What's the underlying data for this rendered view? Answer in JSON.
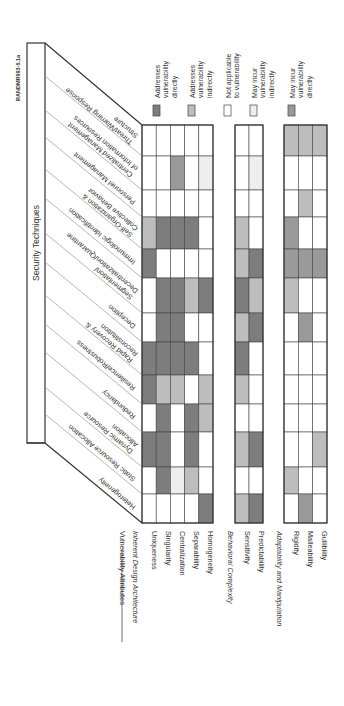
{
  "figure_id": "RANDMR993-5.1a",
  "header": {
    "title": "Security Techniques"
  },
  "attributes_header": "Vulnerability Attributes",
  "legend": [
    {
      "key": "D",
      "label_lines": [
        "Addresses",
        "vulnerability",
        "directly"
      ],
      "color": "#7d7d7d"
    },
    {
      "key": "I",
      "label_lines": [
        "Addresses",
        "vulnerability",
        "indirectly"
      ],
      "color": "#bdbdbd"
    },
    {
      "key": "N",
      "label_lines": [
        "Not applicable",
        "to vulnerability"
      ],
      "color": "#ffffff"
    },
    {
      "key": "m",
      "label_lines": [
        "May incur",
        "vulnerability",
        "indirectly"
      ],
      "color": "#eeeeee"
    },
    {
      "key": "M",
      "label_lines": [
        "May incur",
        "vulnerability",
        "directly"
      ],
      "color": "#9a9a9a"
    }
  ],
  "groups": [
    {
      "name": "Inherent Design Architecture",
      "attributes": [
        "Uniqueness",
        "Singularity",
        "Centralization",
        "Separability",
        "Homogeneity"
      ]
    },
    {
      "name": "Behavioral Complexity",
      "attributes": [
        "Sensitivity",
        "Predictability"
      ]
    },
    {
      "name": "Adaptability and Manipulation",
      "attributes": [
        "Rigidity",
        "Malleability",
        "Gullibility"
      ]
    }
  ],
  "techniques": [
    {
      "lines": [
        "Threat/Warning Response",
        "Structure"
      ]
    },
    {
      "lines": [
        "Centralized Management",
        "of Information Resources"
      ]
    },
    {
      "lines": [
        "Personnel Management"
      ]
    },
    {
      "lines": [
        "Self-Organization &",
        "Collective Behavior"
      ]
    },
    {
      "lines": [
        "Immunologic Identification"
      ]
    },
    {
      "lines": [
        "Segmentation/",
        "Decentralization/Quarantine"
      ]
    },
    {
      "lines": [
        "Deception"
      ]
    },
    {
      "lines": [
        "Rapid Recovery &",
        "Reconstitution"
      ]
    },
    {
      "lines": [
        "Resilience/Robustness"
      ]
    },
    {
      "lines": [
        "Redundancy"
      ]
    },
    {
      "lines": [
        "Dynamic Resource",
        "Allocation"
      ]
    },
    {
      "lines": [
        "Static Resource Allocation"
      ]
    },
    {
      "lines": [
        "Heterogeneity"
      ]
    }
  ],
  "chart_data": {
    "type": "table",
    "columns": [
      "Uniqueness",
      "Singularity",
      "Centralization",
      "Separability",
      "Homogeneity",
      "Sensitivity",
      "Predictability",
      "Rigidity",
      "Malleability",
      "Gullibility"
    ],
    "legend_codes": {
      "D": "Addresses vulnerability directly",
      "I": "Addresses vulnerability indirectly",
      "N": "Not applicable to vulnerability",
      "m": "May incur vulnerability indirectly",
      "M": "May incur vulnerability directly"
    },
    "rows": [
      {
        "technique": "Threat/Warning Response Structure",
        "values": [
          "N",
          "N",
          "N",
          "N",
          "N",
          "N",
          "N",
          "I",
          "I",
          "I"
        ]
      },
      {
        "technique": "Centralized Management of Information Resources",
        "values": [
          "N",
          "N",
          "M",
          "N",
          "m",
          "N",
          "m",
          "N",
          "N",
          "N"
        ]
      },
      {
        "technique": "Personnel Management",
        "values": [
          "N",
          "N",
          "N",
          "N",
          "N",
          "N",
          "N",
          "N",
          "I",
          "N"
        ]
      },
      {
        "technique": "Self-Organization & Collective Behavior",
        "values": [
          "I",
          "D",
          "D",
          "D",
          "N",
          "I",
          "N",
          "M",
          "N",
          "N"
        ]
      },
      {
        "technique": "Immunologic Identification",
        "values": [
          "D",
          "N",
          "N",
          "N",
          "N",
          "I",
          "D",
          "M",
          "M",
          "M"
        ]
      },
      {
        "technique": "Segmentation/Decentralization/Quarantine",
        "values": [
          "N",
          "D",
          "D",
          "I",
          "D",
          "D",
          "I",
          "I",
          "N",
          "N"
        ]
      },
      {
        "technique": "Deception",
        "values": [
          "N",
          "D",
          "D",
          "N",
          "N",
          "I",
          "D",
          "N",
          "M",
          "N"
        ]
      },
      {
        "technique": "Rapid Recovery & Reconstitution",
        "values": [
          "D",
          "D",
          "D",
          "D",
          "N",
          "D",
          "N",
          "N",
          "N",
          "N"
        ]
      },
      {
        "technique": "Resilience/Robustness",
        "values": [
          "D",
          "I",
          "I",
          "N",
          "I",
          "I",
          "N",
          "N",
          "N",
          "N"
        ]
      },
      {
        "technique": "Redundancy",
        "values": [
          "N",
          "D",
          "N",
          "D",
          "I",
          "N",
          "N",
          "N",
          "N",
          "N"
        ]
      },
      {
        "technique": "Dynamic Resource Allocation",
        "values": [
          "D",
          "D",
          "N",
          "D",
          "N",
          "I",
          "D",
          "N",
          "N",
          "I"
        ]
      },
      {
        "technique": "Static Resource Allocation",
        "values": [
          "N",
          "D",
          "m",
          "I",
          "N",
          "N",
          "N",
          "I",
          "N",
          "N"
        ]
      },
      {
        "technique": "Heterogeneity",
        "values": [
          "N",
          "N",
          "N",
          "N",
          "D",
          "I",
          "D",
          "N",
          "M",
          "N"
        ]
      }
    ]
  }
}
